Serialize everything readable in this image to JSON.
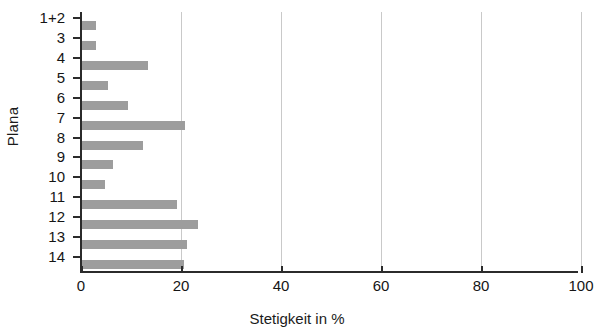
{
  "chart_data": {
    "type": "bar",
    "orientation": "horizontal",
    "title": "",
    "xlabel": "Stetigkeit in %",
    "ylabel": "Plana",
    "categories": [
      "1+2",
      "3",
      "4",
      "5",
      "6",
      "7",
      "8",
      "9",
      "10",
      "11",
      "12",
      "13",
      "14"
    ],
    "values": [
      3,
      3,
      13.4,
      5.4,
      9.4,
      20.8,
      12.4,
      6.4,
      4.8,
      19.2,
      23.4,
      21.2,
      20.6
    ],
    "xlim": [
      0,
      100
    ],
    "xticks": [
      0,
      20,
      40,
      60,
      80,
      100
    ],
    "xtick_labels": [
      "0",
      "20",
      "40",
      "60",
      "80",
      "100"
    ],
    "gridlines": {
      "vertical": [
        20,
        40,
        60,
        80,
        100
      ],
      "horizontal": []
    },
    "legend": null,
    "bar_color": "#9d9d9d",
    "axis_color": "#2b2b2b",
    "grid_color": "#c9c9c9"
  }
}
